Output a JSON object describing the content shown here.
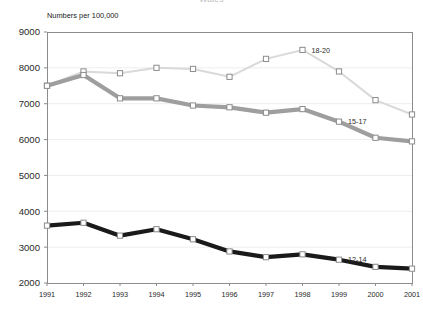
{
  "chart_data": {
    "type": "line",
    "title": "Wales",
    "ylabel": "Numbers per 100,000",
    "xlabel": "",
    "categories": [
      1991,
      1992,
      1993,
      1994,
      1995,
      1996,
      1997,
      1998,
      1999,
      2000,
      2001
    ],
    "xlim": [
      1991,
      2001
    ],
    "ylim": [
      2000,
      9000
    ],
    "yticks": [
      2000,
      3000,
      4000,
      5000,
      6000,
      7000,
      8000,
      9000
    ],
    "ytick_labels": [
      "2000",
      "3000",
      "4000",
      "5000",
      "6000",
      "7000",
      "8000",
      "9000"
    ],
    "xtick_labels": [
      "1991",
      "1992",
      "1993",
      "1994",
      "1995",
      "1996",
      "1997",
      "1998",
      "1999",
      "2000",
      "2001"
    ],
    "grid": true,
    "grid_axis": "y",
    "legend": "inline-annotations",
    "marker": "square",
    "series": [
      {
        "name": "18-20",
        "label": "18-20",
        "color": "#d9d9d9",
        "line_width": 2.0,
        "values": [
          7500,
          7900,
          7850,
          8000,
          7970,
          7750,
          8250,
          8500,
          7900,
          7100,
          6700
        ],
        "annotation": {
          "text": "18-20",
          "at_year": 1998,
          "value": 8500
        }
      },
      {
        "name": "15-17",
        "label": "15-17",
        "color": "#9e9e9e",
        "line_width": 4.2,
        "values": [
          7500,
          7800,
          7150,
          7150,
          6950,
          6900,
          6750,
          6850,
          6500,
          6050,
          5950
        ],
        "annotation": {
          "text": "15-17",
          "at_year": 1999,
          "value": 6500
        }
      },
      {
        "name": "12-14",
        "label": "12-14",
        "color": "#1a1a1a",
        "line_width": 4.2,
        "values": [
          3600,
          3680,
          3320,
          3500,
          3220,
          2880,
          2720,
          2800,
          2650,
          2450,
          2400
        ],
        "annotation": {
          "text": "12-14",
          "at_year": 1999,
          "value": 2650
        }
      }
    ]
  },
  "style": {
    "plot_background": "#ffffff",
    "frame_color": "#8c8c8c",
    "grid_color": "#ededed",
    "marker_face": "#ffffff",
    "marker_edge": "#8c8c8c"
  },
  "geometry": {
    "plot_left": 47,
    "plot_right": 412,
    "plot_top": 32,
    "plot_bottom": 283
  }
}
